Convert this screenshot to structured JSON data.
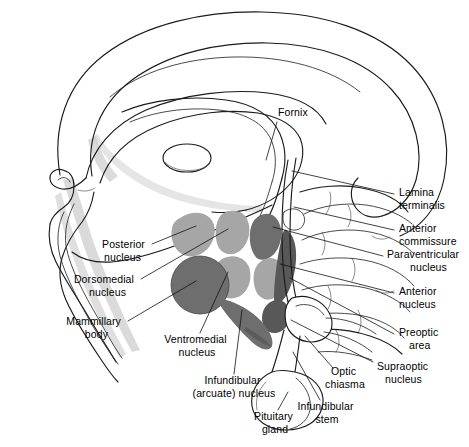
{
  "figure": {
    "background_color": "#ffffff",
    "width": 469,
    "height": 447
  },
  "palette": {
    "outline": "#1b1b1b",
    "leader_line": "#111111",
    "text": "#000000",
    "nucleus_light_gray": "#a6a6a6",
    "nucleus_mid_gray": "#8f8f8f",
    "nucleus_dark_gray": "#6e6e6e",
    "nucleus_darkest_gray": "#585858",
    "shading_gray": "#cfcfcf"
  },
  "labels": [
    {
      "id": "fornix",
      "text": "Fornix",
      "lines": [
        "Fornix"
      ],
      "align": "start",
      "x": 278,
      "y": 116
    },
    {
      "id": "lamina-terminalis",
      "text": "Lamina terminalis",
      "lines": [
        "Lamina",
        "terminalis"
      ],
      "align": "start",
      "x": 399,
      "y": 196
    },
    {
      "id": "anterior-commissure",
      "text": "Anterior commissure",
      "lines": [
        "Anterior",
        "commissure"
      ],
      "align": "start",
      "x": 399,
      "y": 232
    },
    {
      "id": "paraventricular-nucleus",
      "text": "Paraventricular nucleus",
      "lines": [
        "Paraventricular",
        "nucleus"
      ],
      "align": "start",
      "x": 387,
      "y": 258
    },
    {
      "id": "anterior-nucleus",
      "text": "Anterior nucleus",
      "lines": [
        "Anterior",
        "nucleus"
      ],
      "align": "start",
      "x": 399,
      "y": 295
    },
    {
      "id": "preoptic-area",
      "text": "Preoptic area",
      "lines": [
        "Preoptic",
        "area"
      ],
      "align": "start",
      "x": 399,
      "y": 336
    },
    {
      "id": "supraoptic-nucleus",
      "text": "Supraoptic nucleus",
      "lines": [
        "Supraoptic",
        "nucleus"
      ],
      "align": "start",
      "x": 377,
      "y": 370
    },
    {
      "id": "posterior-nucleus",
      "text": "Posterior nucleus",
      "lines": [
        "Posterior",
        "nucleus"
      ],
      "align": "end",
      "x": 148,
      "y": 248
    },
    {
      "id": "dorsomedial-nucleus",
      "text": "Dorsomedial nucleus",
      "lines": [
        "Dorsomedial",
        "nucleus"
      ],
      "align": "end",
      "x": 137,
      "y": 283
    },
    {
      "id": "mammillary-body",
      "text": "Mammillary body",
      "lines": [
        "Mammillary",
        "body"
      ],
      "align": "end",
      "x": 124,
      "y": 325
    },
    {
      "id": "ventromedial-nucleus",
      "text": "Ventromedial nucleus",
      "lines": [
        "Ventromedial",
        "nucleus"
      ],
      "align": "middle",
      "x": 197,
      "y": 343
    },
    {
      "id": "infundibular-arcuate-nucleus",
      "text": "Infundibular (arcuate) nucleus",
      "lines": [
        "Infundibular",
        "(arcuate) nucleus"
      ],
      "align": "middle",
      "x": 234,
      "y": 384
    },
    {
      "id": "pituitary-gland",
      "text": "Pituitary gland",
      "lines": [
        "Pituitary",
        "gland"
      ],
      "align": "middle",
      "x": 275,
      "y": 420
    },
    {
      "id": "infundibular-stem",
      "text": "Infundibular stem",
      "lines": [
        "Infundibular",
        "stem"
      ],
      "align": "middle",
      "x": 327,
      "y": 410
    },
    {
      "id": "optic-chiasma",
      "text": "Optic chiasma",
      "lines": [
        "Optic",
        "chiasma"
      ],
      "align": "middle",
      "x": 345,
      "y": 375
    }
  ],
  "structures": [
    {
      "id": "posterior-nucleus-blob",
      "label": "Posterior nucleus",
      "shade": "light"
    },
    {
      "id": "dorsomedial-nucleus-blob",
      "label": "Dorsomedial nucleus",
      "shade": "light"
    },
    {
      "id": "ventromedial-nucleus-blob",
      "label": "Ventromedial nucleus",
      "shade": "light"
    },
    {
      "id": "paraventricular-nucleus-blob",
      "label": "Paraventricular nucleus",
      "shade": "dark"
    },
    {
      "id": "anterior-nucleus-blob",
      "label": "Anterior nucleus",
      "shade": "light"
    },
    {
      "id": "preoptic-area-blob",
      "label": "Preoptic area",
      "shade": "darkest"
    },
    {
      "id": "supraoptic-nucleus-blob",
      "label": "Supraoptic nucleus",
      "shade": "darkest"
    },
    {
      "id": "mammillary-body-blob",
      "label": "Mammillary body",
      "shade": "dark"
    },
    {
      "id": "infundibular-nucleus-blob",
      "label": "Infundibular (arcuate) nucleus",
      "shade": "dark"
    },
    {
      "id": "corpus-callosum",
      "label": "Corpus callosum",
      "shade": "none"
    },
    {
      "id": "thalamus",
      "label": "Thalamus",
      "shade": "none"
    },
    {
      "id": "massa-intermedia",
      "label": "Massa intermedia",
      "shade": "none"
    },
    {
      "id": "brainstem",
      "label": "Brainstem",
      "shade": "none"
    },
    {
      "id": "pituitary-gland-body",
      "label": "Pituitary gland",
      "shade": "none"
    },
    {
      "id": "optic-chiasma-body",
      "label": "Optic chiasma",
      "shade": "none"
    }
  ]
}
